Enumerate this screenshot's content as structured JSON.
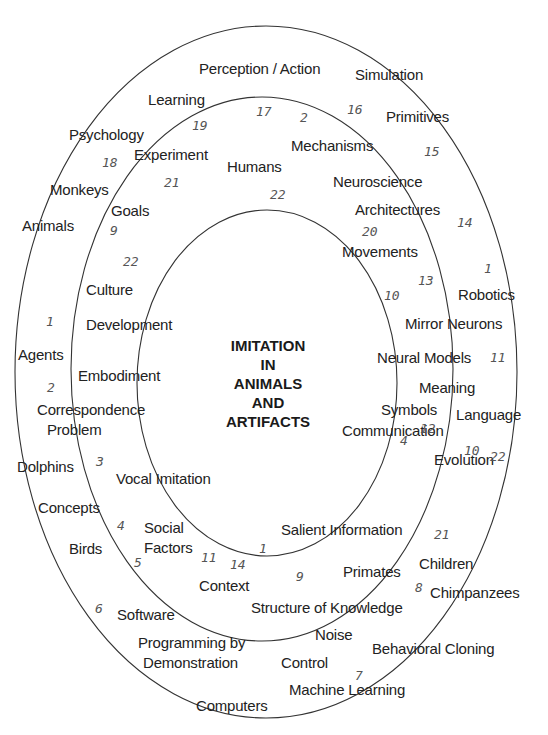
{
  "title": {
    "lines": [
      "IMITATION",
      "IN",
      "ANIMALS",
      "AND",
      "ARTIFACTS"
    ]
  },
  "rings": {
    "stroke": "#333333",
    "inner": {
      "cx": 267,
      "cy": 383,
      "rx": 130,
      "ry": 173
    },
    "middle": {
      "cx": 262,
      "cy": 369,
      "rx": 191,
      "ry": 272
    },
    "outer": {
      "cx": 266,
      "cy": 372,
      "rx": 251,
      "ry": 346
    }
  },
  "labels": [
    {
      "text": "Perception / Action",
      "x": 199,
      "y": 60
    },
    {
      "text": "Simulation",
      "x": 355,
      "y": 66
    },
    {
      "text": "Learning",
      "x": 148,
      "y": 91
    },
    {
      "text": "Primitives",
      "x": 386,
      "y": 108
    },
    {
      "text": "Psychology",
      "x": 69,
      "y": 126
    },
    {
      "text": "Mechanisms",
      "x": 291,
      "y": 137
    },
    {
      "text": "Experiment",
      "x": 134,
      "y": 146
    },
    {
      "text": "Humans",
      "x": 227,
      "y": 158
    },
    {
      "text": "Neuroscience",
      "x": 333,
      "y": 173
    },
    {
      "text": "Monkeys",
      "x": 50,
      "y": 181
    },
    {
      "text": "Goals",
      "x": 111,
      "y": 202
    },
    {
      "text": "Architectures",
      "x": 355,
      "y": 201
    },
    {
      "text": "Animals",
      "x": 22,
      "y": 217
    },
    {
      "text": "Movements",
      "x": 342,
      "y": 243
    },
    {
      "text": "Culture",
      "x": 86,
      "y": 281
    },
    {
      "text": "Robotics",
      "x": 458,
      "y": 286
    },
    {
      "text": "Development",
      "x": 86,
      "y": 316
    },
    {
      "text": "Mirror Neurons",
      "x": 405,
      "y": 315
    },
    {
      "text": "Agents",
      "x": 18,
      "y": 346
    },
    {
      "text": "Neural Models",
      "x": 377,
      "y": 349
    },
    {
      "text": "Embodiment",
      "x": 78,
      "y": 367
    },
    {
      "text": "Meaning",
      "x": 419,
      "y": 379
    },
    {
      "text": "Symbols",
      "x": 381,
      "y": 401
    },
    {
      "text": "Language",
      "x": 456,
      "y": 406
    },
    {
      "text": "Correspondence",
      "x": 37,
      "y": 401
    },
    {
      "text": "Problem",
      "x": 47,
      "y": 421
    },
    {
      "text": "Communication",
      "x": 342,
      "y": 422
    },
    {
      "text": "Dolphins",
      "x": 17,
      "y": 458
    },
    {
      "text": "Evolution",
      "x": 434,
      "y": 451
    },
    {
      "text": "Vocal Imitation",
      "x": 116,
      "y": 470
    },
    {
      "text": "Concepts",
      "x": 38,
      "y": 499
    },
    {
      "text": "Salient Information",
      "x": 281,
      "y": 521
    },
    {
      "text": "Social",
      "x": 144,
      "y": 519
    },
    {
      "text": "Factors",
      "x": 144,
      "y": 539
    },
    {
      "text": "Birds",
      "x": 69,
      "y": 540
    },
    {
      "text": "Children",
      "x": 419,
      "y": 555
    },
    {
      "text": "Context",
      "x": 199,
      "y": 577
    },
    {
      "text": "Primates",
      "x": 343,
      "y": 563
    },
    {
      "text": "Chimpanzees",
      "x": 430,
      "y": 584
    },
    {
      "text": "Software",
      "x": 117,
      "y": 606
    },
    {
      "text": "Structure of Knowledge",
      "x": 251,
      "y": 599
    },
    {
      "text": "Noise",
      "x": 315,
      "y": 626
    },
    {
      "text": "Programming by",
      "x": 138,
      "y": 634
    },
    {
      "text": "Demonstration",
      "x": 143,
      "y": 654
    },
    {
      "text": "Behavioral Cloning",
      "x": 372,
      "y": 640
    },
    {
      "text": "Control",
      "x": 281,
      "y": 654
    },
    {
      "text": "Machine Learning",
      "x": 289,
      "y": 681
    },
    {
      "text": "Computers",
      "x": 196,
      "y": 697
    }
  ],
  "numbers": [
    {
      "text": "17",
      "x": 256,
      "y": 104
    },
    {
      "text": "2",
      "x": 300,
      "y": 110
    },
    {
      "text": "16",
      "x": 347,
      "y": 102
    },
    {
      "text": "19",
      "x": 192,
      "y": 118
    },
    {
      "text": "15",
      "x": 424,
      "y": 144
    },
    {
      "text": "18",
      "x": 102,
      "y": 155
    },
    {
      "text": "21",
      "x": 164,
      "y": 175
    },
    {
      "text": "22",
      "x": 270,
      "y": 187
    },
    {
      "text": "14",
      "x": 457,
      "y": 215
    },
    {
      "text": "9",
      "x": 110,
      "y": 223
    },
    {
      "text": "20",
      "x": 362,
      "y": 224
    },
    {
      "text": "22",
      "x": 123,
      "y": 254
    },
    {
      "text": "13",
      "x": 418,
      "y": 273
    },
    {
      "text": "1",
      "x": 484,
      "y": 261
    },
    {
      "text": "10",
      "x": 384,
      "y": 288
    },
    {
      "text": "1",
      "x": 46,
      "y": 314
    },
    {
      "text": "11",
      "x": 490,
      "y": 350
    },
    {
      "text": "2",
      "x": 47,
      "y": 380
    },
    {
      "text": "12",
      "x": 420,
      "y": 421
    },
    {
      "text": "4",
      "x": 400,
      "y": 433
    },
    {
      "text": "10",
      "x": 464,
      "y": 443
    },
    {
      "text": "22",
      "x": 490,
      "y": 449
    },
    {
      "text": "3",
      "x": 96,
      "y": 454
    },
    {
      "text": "4",
      "x": 117,
      "y": 518
    },
    {
      "text": "21",
      "x": 434,
      "y": 527
    },
    {
      "text": "5",
      "x": 134,
      "y": 555
    },
    {
      "text": "11",
      "x": 201,
      "y": 550
    },
    {
      "text": "14",
      "x": 230,
      "y": 557
    },
    {
      "text": "1",
      "x": 259,
      "y": 541
    },
    {
      "text": "9",
      "x": 296,
      "y": 569
    },
    {
      "text": "8",
      "x": 415,
      "y": 580
    },
    {
      "text": "6",
      "x": 95,
      "y": 601
    },
    {
      "text": "7",
      "x": 355,
      "y": 668
    }
  ]
}
